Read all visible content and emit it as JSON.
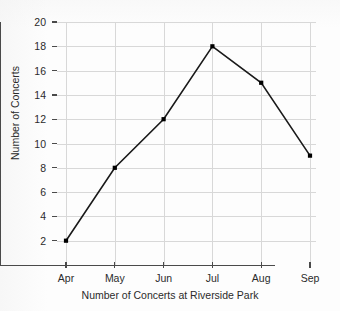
{
  "chart_data": {
    "type": "line",
    "title": "",
    "xlabel": "Number of Concerts at Riverside Park",
    "ylabel": "Number of Concerts",
    "categories": [
      "Apr",
      "May",
      "Jun",
      "Jul",
      "Aug",
      "Sep"
    ],
    "values": [
      2,
      8,
      12,
      18,
      15,
      9
    ],
    "series": [
      {
        "name": "Number of Concerts",
        "values": [
          2,
          8,
          12,
          18,
          15,
          9
        ]
      }
    ],
    "ylim": [
      0,
      20
    ],
    "y_ticks": [
      2,
      4,
      6,
      8,
      10,
      12,
      14,
      16,
      18,
      20
    ],
    "y_tick_labels": [
      "2",
      "4",
      "6",
      "8",
      "10",
      "12",
      "14",
      "16",
      "18",
      "20"
    ],
    "x_tick_labels": [
      "Apr",
      "May",
      "Jun",
      "Jul",
      "Aug",
      "Sep"
    ],
    "grid": true,
    "grid_color": "#d8d8d8",
    "legend": false,
    "legend_position": "none",
    "line_color": "#1a1a1a",
    "marker": "square",
    "marker_color": "#000000",
    "axis_color": "#4a4a4a",
    "background_color": "#fdfdfd"
  }
}
